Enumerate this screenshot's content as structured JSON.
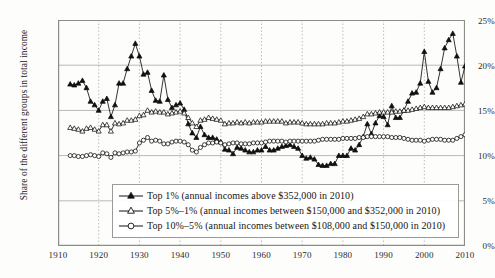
{
  "chart_data": {
    "type": "line",
    "title": "",
    "subtitle": "",
    "xlabel": "",
    "ylabel": "Share of the different groups in total income",
    "xlim": [
      1910,
      2010
    ],
    "ylim": [
      0,
      25
    ],
    "grid": true,
    "legend_position": "bottom-center",
    "y_tick_labels": [
      "0%",
      "5%",
      "10%",
      "15%",
      "20%",
      "25%"
    ],
    "y_tick_values": [
      0,
      5,
      10,
      15,
      20,
      25
    ],
    "x_tick_labels": [
      "1910",
      "1920",
      "1930",
      "1940",
      "1950",
      "1960",
      "1970",
      "1980",
      "1990",
      "2000",
      "2010"
    ],
    "x_tick_values": [
      1910,
      1920,
      1930,
      1940,
      1950,
      1960,
      1970,
      1980,
      1990,
      2000,
      2010
    ],
    "series": [
      {
        "name": "Top 1% (annual incomes above $352,000 in 2010)",
        "marker": "filled-triangle",
        "color": "#101010",
        "x": [
          1913,
          1914,
          1915,
          1916,
          1917,
          1918,
          1919,
          1920,
          1921,
          1922,
          1923,
          1924,
          1925,
          1926,
          1927,
          1928,
          1929,
          1930,
          1931,
          1932,
          1933,
          1934,
          1935,
          1936,
          1937,
          1938,
          1939,
          1940,
          1941,
          1942,
          1943,
          1944,
          1945,
          1946,
          1947,
          1948,
          1949,
          1950,
          1951,
          1952,
          1953,
          1954,
          1955,
          1956,
          1957,
          1958,
          1959,
          1960,
          1961,
          1962,
          1963,
          1964,
          1965,
          1966,
          1967,
          1968,
          1969,
          1970,
          1971,
          1972,
          1973,
          1974,
          1975,
          1976,
          1977,
          1978,
          1979,
          1980,
          1981,
          1982,
          1983,
          1984,
          1985,
          1986,
          1987,
          1988,
          1989,
          1990,
          1991,
          1992,
          1993,
          1994,
          1995,
          1996,
          1997,
          1998,
          1999,
          2000,
          2001,
          2002,
          2003,
          2004,
          2005,
          2006,
          2007,
          2008,
          2009,
          2010
        ],
        "values": [
          17.9,
          17.8,
          18.0,
          18.3,
          17.5,
          16.0,
          15.6,
          15.0,
          16.0,
          16.3,
          14.3,
          15.6,
          18.0,
          18.0,
          19.6,
          21.0,
          22.4,
          21.0,
          19.0,
          19.2,
          17.2,
          16.1,
          16.0,
          18.9,
          16.2,
          15.3,
          15.6,
          15.8,
          15.1,
          13.5,
          12.5,
          12.0,
          13.2,
          12.3,
          12.0,
          12.0,
          11.8,
          11.5,
          10.7,
          10.6,
          10.2,
          10.9,
          10.8,
          10.6,
          10.4,
          10.4,
          10.6,
          10.6,
          11.0,
          10.6,
          10.6,
          10.8,
          11.0,
          11.1,
          11.2,
          11.0,
          10.8,
          10.0,
          9.7,
          9.8,
          9.6,
          9.0,
          8.9,
          8.9,
          9.1,
          9.1,
          10.0,
          10.0,
          10.0,
          10.8,
          10.6,
          11.2,
          12.1,
          13.5,
          12.4,
          13.6,
          14.4,
          14.3,
          13.4,
          15.5,
          14.2,
          14.2,
          15.0,
          16.0,
          16.9,
          17.0,
          18.0,
          21.5,
          18.2,
          17.0,
          17.5,
          19.6,
          21.9,
          22.8,
          23.5,
          21.0,
          18.1,
          19.9
        ]
      },
      {
        "name": "Top 5%–1% (annual incomes between $150,000 and $352,000 in 2010)",
        "marker": "open-triangle",
        "color": "#101010",
        "x": [
          1913,
          1914,
          1915,
          1916,
          1917,
          1918,
          1919,
          1920,
          1921,
          1922,
          1923,
          1924,
          1925,
          1926,
          1927,
          1928,
          1929,
          1930,
          1931,
          1932,
          1933,
          1934,
          1935,
          1936,
          1937,
          1938,
          1939,
          1940,
          1941,
          1942,
          1943,
          1944,
          1945,
          1946,
          1947,
          1948,
          1949,
          1950,
          1951,
          1952,
          1953,
          1954,
          1955,
          1956,
          1957,
          1958,
          1959,
          1960,
          1961,
          1962,
          1963,
          1964,
          1965,
          1966,
          1967,
          1968,
          1969,
          1970,
          1971,
          1972,
          1973,
          1974,
          1975,
          1976,
          1977,
          1978,
          1979,
          1980,
          1981,
          1982,
          1983,
          1984,
          1985,
          1986,
          1987,
          1988,
          1989,
          1990,
          1991,
          1992,
          1993,
          1994,
          1995,
          1996,
          1997,
          1998,
          1999,
          2000,
          2001,
          2002,
          2003,
          2004,
          2005,
          2006,
          2007,
          2008,
          2009,
          2010
        ],
        "values": [
          13.1,
          13.0,
          12.9,
          12.7,
          13.0,
          13.1,
          12.9,
          12.7,
          13.4,
          13.4,
          12.7,
          13.6,
          13.5,
          13.6,
          13.9,
          13.9,
          14.0,
          14.4,
          14.5,
          15.0,
          14.8,
          14.9,
          14.8,
          14.8,
          14.6,
          14.7,
          14.8,
          14.9,
          14.7,
          14.2,
          13.6,
          13.2,
          13.9,
          14.0,
          14.2,
          14.1,
          14.0,
          13.9,
          13.5,
          13.6,
          13.6,
          13.7,
          13.6,
          13.7,
          13.6,
          13.7,
          13.7,
          13.7,
          13.8,
          13.8,
          13.8,
          13.8,
          13.8,
          13.6,
          13.7,
          13.7,
          13.7,
          13.6,
          13.5,
          13.5,
          13.5,
          13.5,
          13.5,
          13.6,
          13.6,
          13.6,
          13.7,
          13.8,
          13.8,
          13.9,
          14.0,
          14.1,
          14.3,
          14.6,
          14.6,
          14.7,
          14.8,
          14.8,
          14.8,
          14.8,
          14.9,
          14.9,
          15.0,
          15.0,
          15.1,
          15.2,
          15.3,
          15.4,
          15.3,
          15.3,
          15.3,
          15.3,
          15.3,
          15.3,
          15.4,
          15.5,
          15.6,
          15.7
        ]
      },
      {
        "name": "Top 10%–5% (annual incomes between $108,000 and $150,000 in 2010)",
        "marker": "open-circle",
        "color": "#101010",
        "x": [
          1913,
          1914,
          1915,
          1916,
          1917,
          1918,
          1919,
          1920,
          1921,
          1922,
          1923,
          1924,
          1925,
          1926,
          1927,
          1928,
          1929,
          1930,
          1931,
          1932,
          1933,
          1934,
          1935,
          1936,
          1937,
          1938,
          1939,
          1940,
          1941,
          1942,
          1943,
          1944,
          1945,
          1946,
          1947,
          1948,
          1949,
          1950,
          1951,
          1952,
          1953,
          1954,
          1955,
          1956,
          1957,
          1958,
          1959,
          1960,
          1961,
          1962,
          1963,
          1964,
          1965,
          1966,
          1967,
          1968,
          1969,
          1970,
          1971,
          1972,
          1973,
          1974,
          1975,
          1976,
          1977,
          1978,
          1979,
          1980,
          1981,
          1982,
          1983,
          1984,
          1985,
          1986,
          1987,
          1988,
          1989,
          1990,
          1991,
          1992,
          1993,
          1994,
          1995,
          1996,
          1997,
          1998,
          1999,
          2000,
          2001,
          2002,
          2003,
          2004,
          2005,
          2006,
          2007,
          2008,
          2009,
          2010
        ],
        "values": [
          10.0,
          10.0,
          9.9,
          9.9,
          10.0,
          10.1,
          10.0,
          9.9,
          10.3,
          10.2,
          9.8,
          10.3,
          10.2,
          10.3,
          10.4,
          10.4,
          10.5,
          11.4,
          11.7,
          12.0,
          11.6,
          11.7,
          11.6,
          11.3,
          11.3,
          11.5,
          11.6,
          11.6,
          11.5,
          11.2,
          10.6,
          10.4,
          10.9,
          11.2,
          11.4,
          11.4,
          11.5,
          11.4,
          11.2,
          11.3,
          11.4,
          11.4,
          11.3,
          11.3,
          11.3,
          11.4,
          11.4,
          11.4,
          11.5,
          11.6,
          11.6,
          11.6,
          11.6,
          11.5,
          11.6,
          11.6,
          11.6,
          11.6,
          11.6,
          11.6,
          11.6,
          11.7,
          11.8,
          11.8,
          11.8,
          11.8,
          11.8,
          11.9,
          11.9,
          11.9,
          11.9,
          12.0,
          12.0,
          12.1,
          12.1,
          12.1,
          12.1,
          12.1,
          12.1,
          12.0,
          12.0,
          12.0,
          11.9,
          11.8,
          11.7,
          11.7,
          11.7,
          11.6,
          11.7,
          11.8,
          11.8,
          11.8,
          11.7,
          11.7,
          11.7,
          11.9,
          12.1,
          12.3
        ]
      }
    ]
  },
  "legend": {
    "items": [
      {
        "marker": "filled-triangle",
        "label": "Top 1% (annual incomes above $352,000 in 2010)"
      },
      {
        "marker": "open-triangle",
        "label": "Top 5%–1% (annual incomes between $150,000 and $352,000 in 2010)"
      },
      {
        "marker": "open-circle",
        "label": "Top 10%–5% (annual incomes between $108,000 and $150,000 in 2010)"
      }
    ]
  },
  "colors": {
    "ink": "#101010",
    "gridline": "#b9b9b4",
    "axis": "#8d8d88",
    "background": "#fdfdfc"
  }
}
